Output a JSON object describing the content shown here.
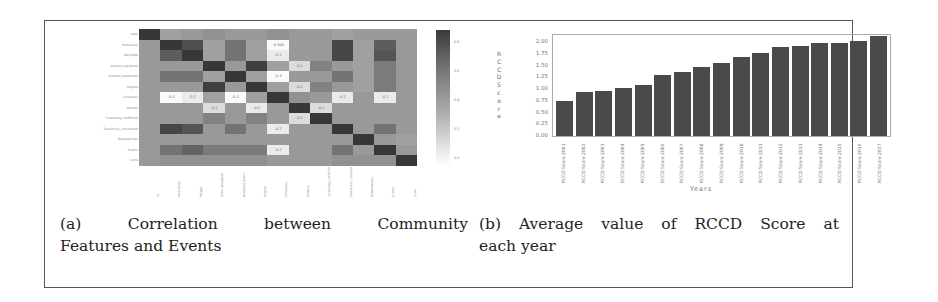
{
  "captions": {
    "a": {
      "line1": [
        "(a)",
        "Correlation",
        "between",
        "Community"
      ],
      "line2": "Features and Events"
    },
    "b": {
      "line1": [
        "(b)",
        "Average",
        "value",
        "of",
        "RCCD",
        "Score",
        "at"
      ],
      "line2": "each year"
    }
  },
  "chart_data": [
    {
      "type": "heatmap",
      "title": "Correlation between Community Features and Events",
      "xlabel": "",
      "ylabel": "",
      "row_labels": [
        "label",
        "Modularity",
        "Weighted",
        "directed_weighted",
        "directed_weighted2",
        "Degree",
        "Closeness",
        "Density",
        "Clustering_coefficient",
        "Transitivity_component",
        "Betweenness",
        "Events",
        "score"
      ],
      "col_labels": [
        "al",
        "Modularity",
        "Weight",
        "direct_weighted",
        "weighted_direct",
        "Degree",
        "Closeness",
        "Density",
        "clustering_coefficient",
        "transitivity_component",
        "Betweenness",
        "Events",
        "score"
      ],
      "colorbar_ticks": [
        "0.8",
        "0.6",
        "0.4",
        "0.2",
        "0.0"
      ],
      "values": [
        [
          1.0,
          0.3,
          0.35,
          0.4,
          0.35,
          0.35,
          0.4,
          0.35,
          0.35,
          0.3,
          0.35,
          0.35,
          0.35
        ],
        [
          0.35,
          1.0,
          0.84,
          0.3,
          0.6,
          0.3,
          -0.3,
          0.35,
          0.35,
          0.9,
          0.3,
          0.75,
          0.35
        ],
        [
          0.35,
          0.75,
          1.0,
          0.3,
          0.6,
          0.3,
          -0.2,
          0.35,
          0.35,
          0.9,
          0.3,
          0.8,
          0.35
        ],
        [
          0.35,
          0.35,
          0.35,
          1.0,
          0.35,
          0.95,
          0.3,
          -0.1,
          0.5,
          0.35,
          0.3,
          0.55,
          0.35
        ],
        [
          0.35,
          0.6,
          0.6,
          0.3,
          1.0,
          0.3,
          -0.3,
          0.35,
          0.35,
          0.6,
          0.3,
          0.55,
          0.35
        ],
        [
          0.35,
          0.35,
          0.35,
          0.95,
          0.35,
          1.0,
          0.3,
          -0.1,
          0.5,
          0.35,
          0.3,
          0.55,
          0.35
        ],
        [
          0.35,
          -0.3,
          -0.2,
          0.3,
          -0.3,
          0.3,
          1.0,
          0.4,
          0.35,
          -0.2,
          0.35,
          -0.2,
          0.35
        ],
        [
          0.35,
          0.35,
          0.35,
          -0.1,
          0.35,
          -0.2,
          0.35,
          1.0,
          -0.1,
          0.35,
          0.35,
          0.35,
          0.35
        ],
        [
          0.35,
          0.35,
          0.35,
          0.5,
          0.35,
          0.5,
          0.35,
          -0.1,
          1.0,
          0.35,
          0.35,
          0.35,
          0.35
        ],
        [
          0.35,
          0.9,
          0.8,
          0.35,
          0.6,
          0.35,
          -0.2,
          0.35,
          0.35,
          1.0,
          0.35,
          0.6,
          0.35
        ],
        [
          0.35,
          0.35,
          0.35,
          0.35,
          0.35,
          0.35,
          0.35,
          0.35,
          0.35,
          0.35,
          1.0,
          0.35,
          0.3
        ],
        [
          0.35,
          0.6,
          0.7,
          0.55,
          0.55,
          0.55,
          -0.2,
          0.35,
          0.35,
          0.6,
          0.35,
          1.0,
          0.35
        ],
        [
          0.35,
          0.4,
          0.4,
          0.4,
          0.4,
          0.4,
          0.35,
          0.35,
          0.35,
          0.4,
          0.4,
          0.4,
          1.0
        ]
      ],
      "annotations": [
        {
          "row": 1,
          "col": 6,
          "text": "-0.300"
        },
        {
          "row": 2,
          "col": 6,
          "text": "-0.2"
        },
        {
          "row": 3,
          "col": 7,
          "text": "-0.1"
        },
        {
          "row": 4,
          "col": 6,
          "text": "-0.3"
        },
        {
          "row": 5,
          "col": 7,
          "text": "-0.1"
        },
        {
          "row": 6,
          "col": 1,
          "text": "-0.3"
        },
        {
          "row": 6,
          "col": 2,
          "text": "-0.2"
        },
        {
          "row": 6,
          "col": 4,
          "text": "-0.3"
        },
        {
          "row": 6,
          "col": 9,
          "text": "-0.2"
        },
        {
          "row": 6,
          "col": 11,
          "text": "-0.2"
        },
        {
          "row": 7,
          "col": 3,
          "text": "-0.1"
        },
        {
          "row": 7,
          "col": 5,
          "text": "-0.2"
        },
        {
          "row": 7,
          "col": 8,
          "text": "-0.1"
        },
        {
          "row": 8,
          "col": 7,
          "text": "-0.1"
        },
        {
          "row": 9,
          "col": 6,
          "text": "-0.2"
        },
        {
          "row": 11,
          "col": 6,
          "text": "-0.2"
        }
      ]
    },
    {
      "type": "bar",
      "title": "Average value of RCCD Score at each year",
      "xlabel": "Years",
      "ylabel": "RCCD Score",
      "ylim": [
        0,
        2.15
      ],
      "yticks": [
        "0.00",
        "0.25",
        "0.50",
        "0.75",
        "1.00",
        "1.25",
        "1.50",
        "1.75",
        "2.00"
      ],
      "categories": [
        "RCCD_Score_2001",
        "RCCD_Score_2002",
        "RCCD_Score_2003",
        "RCCD_Score_2004",
        "RCCD_Score_2005",
        "RCCD_Score_2006",
        "RCCD_Score_2007",
        "RCCD_Score_2008",
        "RCCD_Score_2009",
        "RCCD_Score_2010",
        "RCCD_Score_2011",
        "RCCD_Score_2012",
        "RCCD_Score_2013",
        "RCCD_Score_2014",
        "RCCD_Score_2015",
        "RCCD_Score_2016",
        "RCCD_Score_2017"
      ],
      "values": [
        0.74,
        0.94,
        0.95,
        1.02,
        1.09,
        1.29,
        1.36,
        1.47,
        1.55,
        1.68,
        1.77,
        1.89,
        1.91,
        1.97,
        1.98,
        2.02,
        2.13
      ],
      "grid": false
    }
  ]
}
